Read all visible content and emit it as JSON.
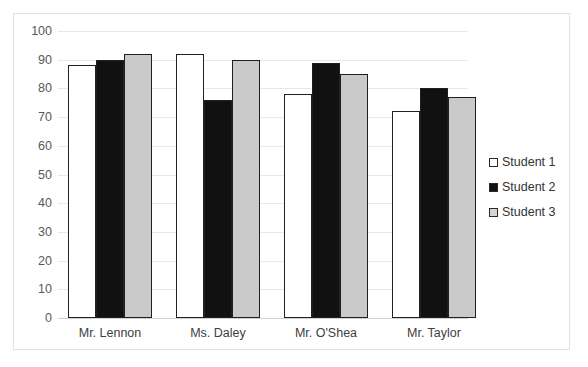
{
  "chart_data": {
    "type": "bar",
    "title": "",
    "subtitle": "",
    "xlabel": "",
    "ylabel": "",
    "categories": [
      "Mr. Lennon",
      "Ms. Daley",
      "Mr. O'Shea",
      "Mr. Taylor"
    ],
    "series": [
      {
        "name": "Student 1",
        "values": [
          88,
          92,
          78,
          72
        ],
        "color": "#ffffff",
        "swatch": "white-square"
      },
      {
        "name": "Student 2",
        "values": [
          90,
          76,
          89,
          80
        ],
        "color": "#111111",
        "swatch": "black-square"
      },
      {
        "name": "Student 3",
        "values": [
          92,
          90,
          85,
          77
        ],
        "color": "#c9c9c9",
        "swatch": "gray-square"
      }
    ],
    "ylim": [
      0,
      100
    ],
    "yticks": [
      0,
      10,
      20,
      30,
      40,
      50,
      60,
      70,
      80,
      90,
      100
    ],
    "ytick_labels": [
      "0",
      "10",
      "20",
      "30",
      "40",
      "50",
      "60",
      "70",
      "80",
      "90",
      "100"
    ],
    "grid": true,
    "grid_axis": "y",
    "legend_position": "right",
    "legend_entries": [
      "Student 1",
      "Student 2",
      "Student 3"
    ],
    "annotations": [],
    "plot_background": "#ffffff",
    "gridline_color": "#e8e8e8",
    "bar_border_color": "#202020",
    "axis_text_color": "#595959"
  }
}
